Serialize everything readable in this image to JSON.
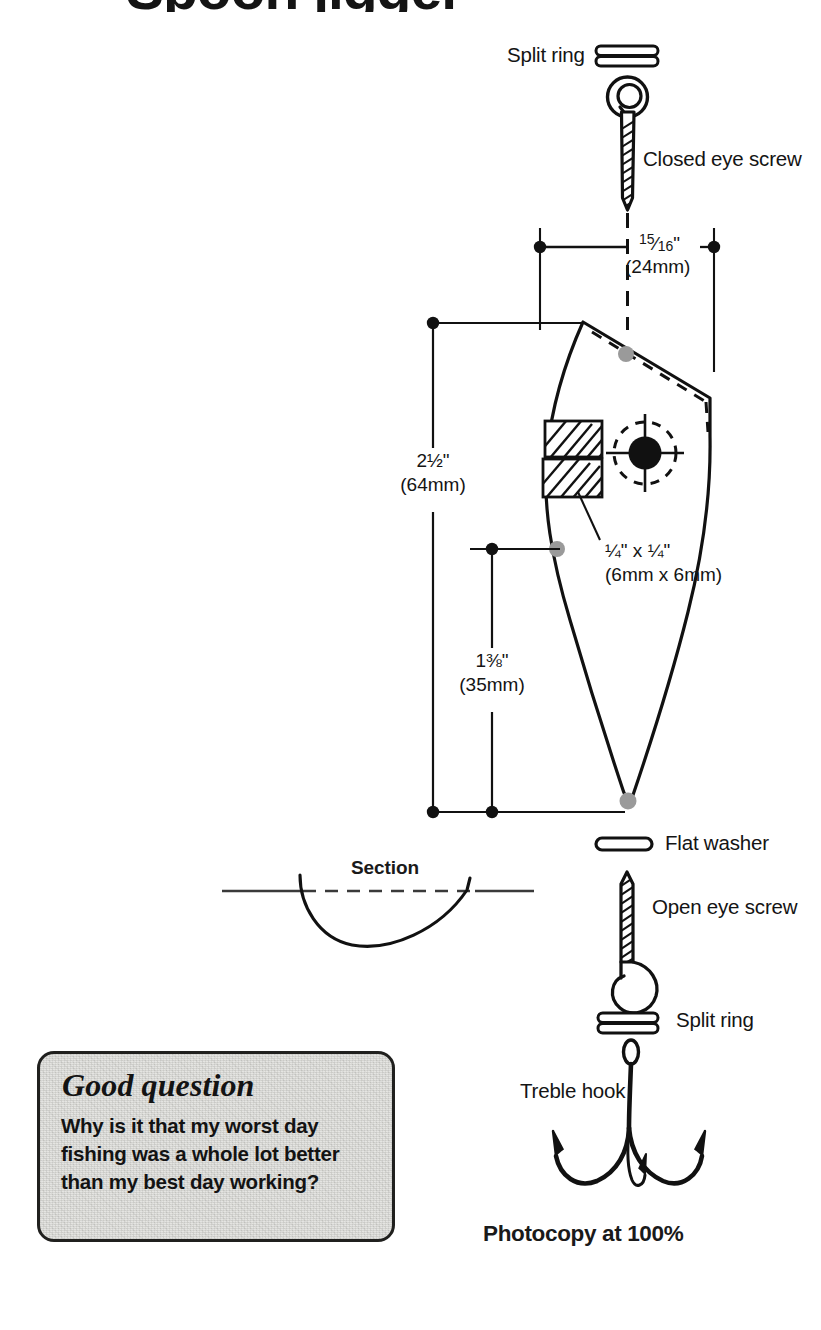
{
  "page": {
    "title_cropped": "Spoon jigger",
    "photocopy_note": "Photocopy at 100%",
    "section_label": "Section"
  },
  "labels": {
    "split_ring_top": "Split ring",
    "closed_eye_screw": "Closed eye screw",
    "flat_washer": "Flat washer",
    "open_eye_screw": "Open eye screw",
    "split_ring_bottom": "Split ring",
    "treble_hook": "Treble hook"
  },
  "dimensions": {
    "width": {
      "whole": "",
      "numerator": "15",
      "denominator": "16",
      "unit": "\"",
      "metric": "(24mm)",
      "inches_text": "15/16\"",
      "metric_text": "(24mm)"
    },
    "length_total": {
      "whole": "2",
      "numerator": "1",
      "denominator": "2",
      "unit": "\"",
      "metric": "(64mm)",
      "inches_text": "2½\"",
      "metric_text": "(64mm)"
    },
    "length_partial": {
      "whole": "1",
      "numerator": "3",
      "denominator": "8",
      "unit": "\"",
      "metric": "(35mm)",
      "inches_text": "1⅜\"",
      "metric_text": "(35mm)"
    },
    "slot": {
      "inches_text": "¼\" x  ¼\"",
      "metric_text": "(6mm x 6mm)"
    }
  },
  "good_question": {
    "heading": "Good question",
    "body": "Why is it that my worst day fishing was a whole lot better than my best day working?"
  },
  "colors": {
    "ink": "#141414",
    "outline": "#111111",
    "marker_gray": "#9a9a9a",
    "box_fill": "#dededa",
    "box_border": "#20201e",
    "paper": "#ffffff"
  },
  "icons": {
    "split_ring": "split-ring-icon",
    "closed_eye_screw": "closed-eye-screw-icon",
    "flat_washer": "flat-washer-icon",
    "open_eye_screw": "open-eye-screw-icon",
    "treble_hook": "treble-hook-icon",
    "lure_body": "lure-body-icon",
    "section_profile": "section-profile-icon"
  }
}
